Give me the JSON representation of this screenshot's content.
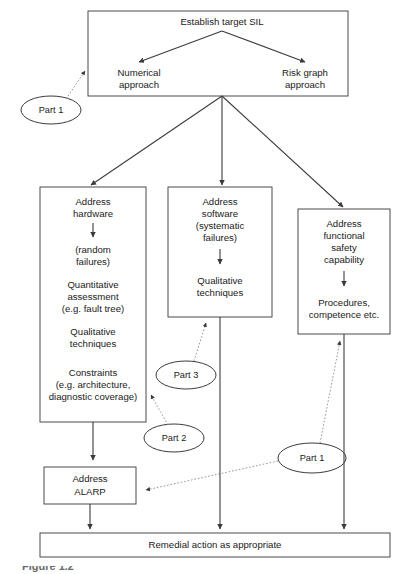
{
  "figure": {
    "caption": "Figure 1.2",
    "type": "flowchart",
    "background_color": "#ffffff",
    "line_color": "#3c3c3c",
    "dotted_line_color": "#8a8a8a",
    "text_color": "#1a1a1a"
  },
  "nodes": {
    "top_box": {
      "title": "Establish target SIL",
      "left_branch": [
        "Numerical",
        "approach"
      ],
      "right_branch": [
        "Risk graph",
        "approach"
      ]
    },
    "hardware_box": {
      "heading": [
        "Address",
        "hardware"
      ],
      "sub1": [
        "(random",
        "failures)"
      ],
      "sub2": [
        "Quantitative",
        "assessment",
        "(e.g. fault tree)"
      ],
      "sub3": [
        "Qualitative",
        "techniques"
      ],
      "sub4": [
        "Constraints",
        "(e.g. architecture,",
        "diagnostic coverage)"
      ]
    },
    "software_box": {
      "heading": [
        "Address",
        "software",
        "(systematic",
        "failures)"
      ],
      "sub1": [
        "Qualitative",
        "techniques"
      ]
    },
    "capability_box": {
      "heading": [
        "Address",
        "functional",
        "safety",
        "capability"
      ],
      "sub1": [
        "Procedures,",
        "competence etc."
      ]
    },
    "alarp_box": {
      "lines": [
        "Address",
        "ALARP"
      ]
    },
    "remedial_box": {
      "label": "Remedial action as appropriate"
    }
  },
  "callouts": [
    {
      "id": "part1-top-left",
      "label": "Part 1"
    },
    {
      "id": "part3-mid",
      "label": "Part 3"
    },
    {
      "id": "part2-mid",
      "label": "Part 2"
    },
    {
      "id": "part1-bottom-right",
      "label": "Part 1"
    }
  ]
}
